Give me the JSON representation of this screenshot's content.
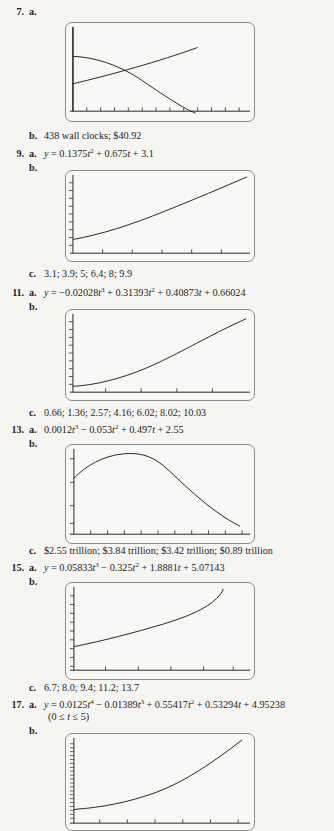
{
  "page": {
    "background_color": "#f6f5f2",
    "ink_color": "#231f1c",
    "screen_border_color": "#8d8d8a",
    "curve_color": "#2a2724"
  },
  "exercises": [
    {
      "number": "7.",
      "parts": {
        "a_label": "a.",
        "a_text": "",
        "b_label": "b.",
        "b_text": "438 wall clocks; $40.92",
        "graph_part": "a"
      },
      "graph": {
        "type": "line",
        "description": "two curves crossing: one decreasing concave-down, one increasing concave-down",
        "series": [
          {
            "name": "cost-curve",
            "points": "M0,30 C22,31 44,38 66,52 C92,70 118,86 140,93"
          },
          {
            "name": "revenue-curve",
            "points": "M0,58 C40,49 90,36 130,25 C150,19 165,14 176,11"
          }
        ],
        "axes": {
          "x_ticks": 12,
          "y_axis": true,
          "grid": false
        }
      }
    },
    {
      "number": "9.",
      "parts": {
        "a_label": "a.",
        "a_text": "y = 0.1375t² + 0.675t + 3.1",
        "b_label": "b.",
        "c_label": "c.",
        "c_text": "3.1; 3.9; 5; 6.4; 8; 9.9"
      },
      "graph": {
        "type": "line",
        "description": "increasing concave-up quadratic",
        "series": [
          {
            "name": "quadratic",
            "points": "M0,70 C30,64 60,54 95,40 C125,28 155,15 183,5"
          }
        ],
        "axes": {
          "x_ticks": 6,
          "y_ticks": 9,
          "grid": false
        }
      }
    },
    {
      "number": "11.",
      "parts": {
        "a_label": "a.",
        "a_text": "y = −0.02028t³ + 0.31393t² + 0.40873t + 0.66024",
        "b_label": "b.",
        "c_label": "c.",
        "c_text": "0.66; 1.36; 2.57; 4.16; 6.02; 8.02; 10.03"
      },
      "graph": {
        "type": "line",
        "description": "increasing cubic, concave up",
        "series": [
          {
            "name": "cubic",
            "points": "M0,77 C25,75 52,68 80,56 C112,42 145,24 172,12"
          }
        ],
        "axes": {
          "x_ticks": 5,
          "y_ticks": 9,
          "grid": false
        }
      }
    },
    {
      "number": "13.",
      "parts": {
        "a_label": "a.",
        "a_text": "0.0012t³ − 0.053t² + 0.497t + 2.55",
        "b_label": "b.",
        "c_label": "c.",
        "c_text": "$2.55 trillion; $3.84 trillion; $3.42 trillion; $0.89 trillion"
      },
      "graph": {
        "type": "line",
        "description": "rises to a maximum then falls steeply",
        "series": [
          {
            "name": "cubic-hump",
            "points": "M0,32 C12,20 28,10 48,7 C68,5 80,10 94,22 C116,42 140,64 166,80"
          }
        ],
        "axes": {
          "x_ticks": 10,
          "y_ticks": 4,
          "grid": false
        }
      }
    },
    {
      "number": "15.",
      "parts": {
        "a_label": "a.",
        "a_text": "y = 0.05833t³ − 0.325t² + 1.8881t + 5.07143",
        "b_label": "b.",
        "c_label": "c.",
        "c_text": "6.7; 8.0; 9.4; 11.2; 13.7"
      },
      "graph": {
        "type": "line",
        "description": "nearly linear then curving upward at the right",
        "series": [
          {
            "name": "cubic",
            "points": "M0,62 C30,55 60,47 90,38 C115,31 133,24 146,14 C150,11 152,8 153,5"
          }
        ],
        "axes": {
          "x_ticks": 5,
          "y_ticks": 9,
          "grid": false
        }
      }
    },
    {
      "number": "17.",
      "parts": {
        "a_label": "a.",
        "a_text": "y = 0.0125t⁴ − 0.01389t³ + 0.55417t² + 0.53294t + 4.95238",
        "a_text2": "(0 ≤ t ≤ 5)",
        "b_label": "b."
      },
      "graph": {
        "type": "line",
        "description": "increasing quartic, concave up, rising sharply at right",
        "series": [
          {
            "name": "quartic",
            "points": "M0,74 C30,72 58,68 86,58 C116,47 145,28 172,6"
          }
        ],
        "axes": {
          "x_ticks": 6,
          "y_ticks": 20,
          "grid": false
        }
      }
    }
  ]
}
